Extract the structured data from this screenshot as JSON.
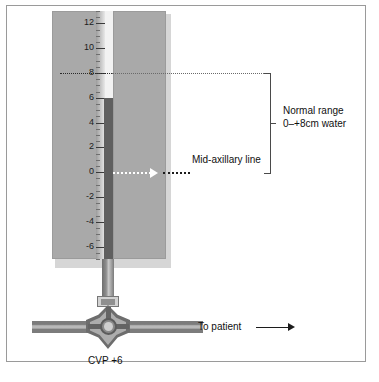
{
  "figure": {
    "scale_unit": "cm water"
  },
  "scale": {
    "labels": [
      "12",
      "10",
      "8",
      "6",
      "4",
      "2",
      "0",
      "-2",
      "-4",
      "-6"
    ],
    "values": [
      12,
      10,
      8,
      6,
      4,
      2,
      0,
      -2,
      -4,
      -6
    ],
    "max": 13,
    "min": -7
  },
  "fluid": {
    "level_value": 6,
    "color": "#5f5f5f"
  },
  "annotations": {
    "normal_range_line1": "Normal range",
    "normal_range_line2": "0–+8cm water",
    "mid_axillary": "Mid-axillary line",
    "to_patient": "To patient",
    "cvp_reading": "CVP +6"
  },
  "bracket": {
    "top_value": 8,
    "bottom_value": 0
  },
  "colors": {
    "panel": "#a9a9a9",
    "panel_shadow": "#d6d6d6",
    "tube": "#f2f2f2",
    "fluid": "#5f5f5f",
    "tubing": "#7c7c7c",
    "stopcock": "#8a8a8a",
    "text": "#101010",
    "frame": "#9a9a9a"
  }
}
